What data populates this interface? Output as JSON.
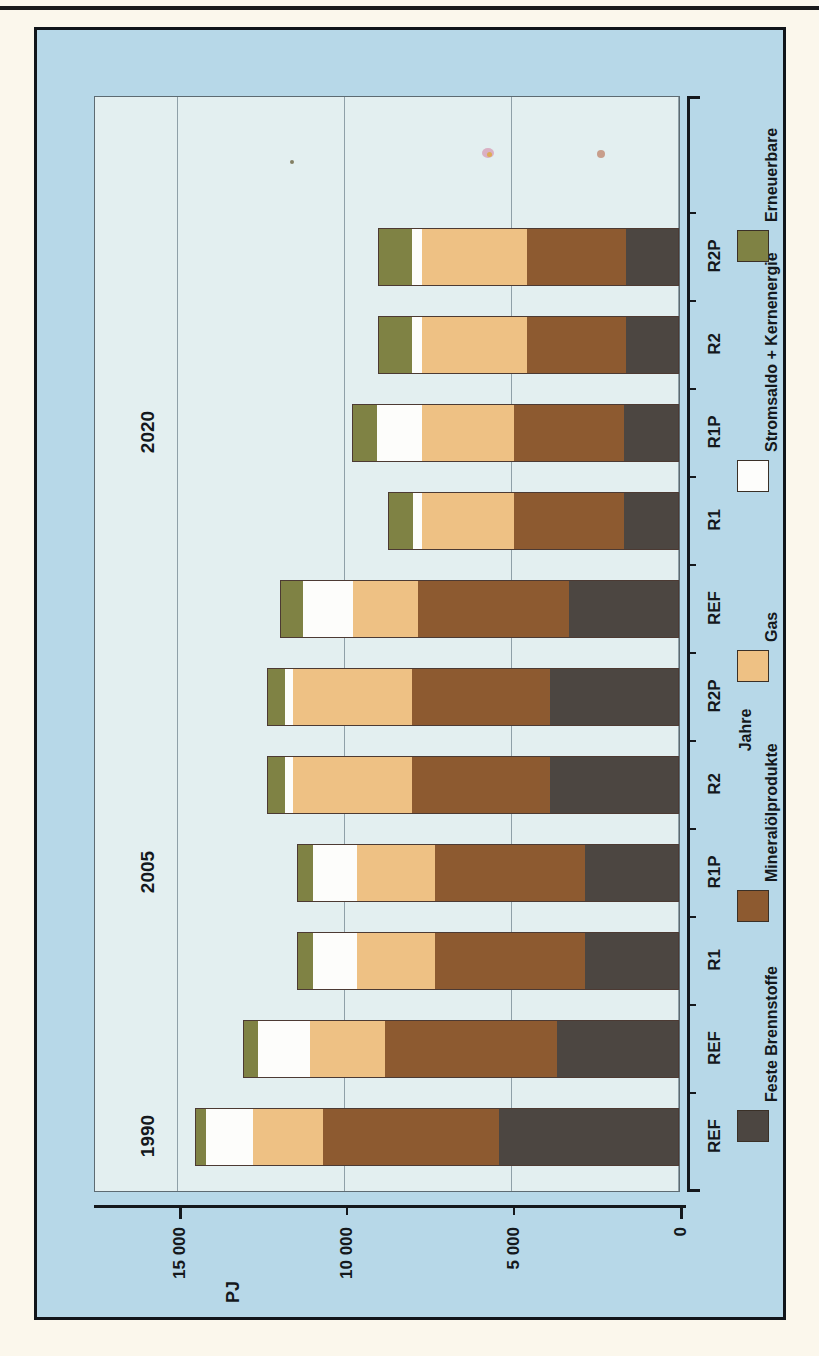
{
  "figure": {
    "orientation": "rotated-90-ccw",
    "value_axis_title": "PJ",
    "category_axis_title": "Jahre"
  },
  "axis": {
    "ticks": [
      "15 000",
      "10 000",
      "5 000",
      "0"
    ],
    "tick_values": [
      15000,
      10000,
      5000,
      0
    ]
  },
  "groups": [
    {
      "year": "1990"
    },
    {
      "year": "2005"
    },
    {
      "year": "2020"
    }
  ],
  "legend": {
    "items": [
      {
        "label": "Feste Brennstoffe",
        "color": "#4c4641"
      },
      {
        "label": "Mineralölprodukte",
        "color": "#8d5a30"
      },
      {
        "label": "Gas",
        "color": "#eec184"
      },
      {
        "label": "Stromsaldo + Kernenergie",
        "color": "#fdfdfb"
      },
      {
        "label": "Erneuerbare",
        "color": "#7f8244"
      }
    ]
  },
  "chart_data": {
    "type": "bar",
    "title": "",
    "xlabel": "Jahre",
    "ylabel": "PJ",
    "ylim": [
      0,
      15000
    ],
    "grid": true,
    "legend_position": "right",
    "orientation": "horizontal-stacked",
    "categories": [
      "REF",
      "REF",
      "R1",
      "R1P",
      "R2",
      "R2P",
      "REF",
      "R1",
      "R1P",
      "R2",
      "R2P"
    ],
    "group_labels": [
      "1990",
      "2005",
      "2020"
    ],
    "group_spans": [
      1,
      5,
      5
    ],
    "series": [
      {
        "name": "Feste Brennstoffe",
        "color": "#4c4641",
        "values": [
          5400,
          3650,
          2800,
          2800,
          3850,
          3850,
          3300,
          1650,
          1650,
          1600,
          1600
        ]
      },
      {
        "name": "Mineralölprodukte",
        "color": "#8d5a30",
        "values": [
          5250,
          5150,
          4500,
          4500,
          4150,
          4150,
          4500,
          3300,
          3300,
          2950,
          2950
        ]
      },
      {
        "name": "Gas",
        "color": "#eec184",
        "values": [
          2100,
          2250,
          2350,
          2350,
          3550,
          3550,
          1950,
          2750,
          2750,
          3150,
          3150
        ]
      },
      {
        "name": "Stromsaldo + Kernenergie",
        "color": "#fdfdfb",
        "values": [
          1400,
          1550,
          1300,
          1300,
          250,
          250,
          1500,
          250,
          1350,
          300,
          300
        ]
      },
      {
        "name": "Erneuerbare",
        "color": "#7f8244",
        "values": [
          350,
          450,
          500,
          500,
          550,
          550,
          700,
          750,
          750,
          1000,
          1000
        ]
      }
    ],
    "totals": [
      14500,
      13050,
      11450,
      11450,
      12350,
      12350,
      11950,
      8700,
      9800,
      9000,
      9000
    ]
  }
}
